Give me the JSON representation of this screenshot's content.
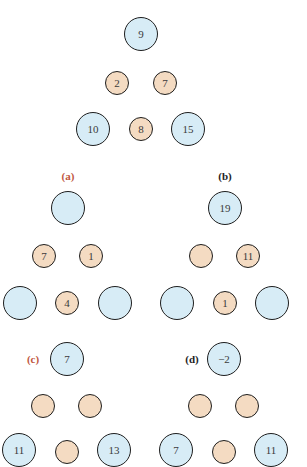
{
  "colors": {
    "big_fill": "#d7ecf6",
    "small_fill": "#f4dbc2",
    "stroke": "#1e1e1e",
    "label_red": "#c0573f",
    "label_black": "#1e1e1e"
  },
  "example": {
    "top": "9",
    "mid_left": "2",
    "mid_right": "7",
    "bot_left": "10",
    "bot_mid": "8",
    "bot_right": "15"
  },
  "puzzles": {
    "a": {
      "label": "(a)",
      "top": "",
      "mid_left": "7",
      "mid_right": "1",
      "bot_left": "",
      "bot_mid": "4",
      "bot_right": ""
    },
    "b": {
      "label": "(b)",
      "top": "19",
      "mid_left": "",
      "mid_right": "11",
      "bot_left": "",
      "bot_mid": "1",
      "bot_right": ""
    },
    "c": {
      "label": "(c)",
      "top": "7",
      "mid_left": "",
      "mid_right": "",
      "bot_left": "11",
      "bot_mid": "",
      "bot_right": "13"
    },
    "d": {
      "label": "(d)",
      "top": "−2",
      "mid_left": "",
      "mid_right": "",
      "bot_left": "7",
      "bot_mid": "",
      "bot_right": "11"
    }
  }
}
